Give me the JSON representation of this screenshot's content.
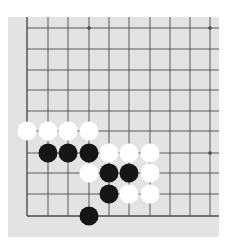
{
  "board": {
    "label": "Go board diagram (lower-left corner region)",
    "background_color": "#e3e3e3",
    "line_color": "#4a4a4a",
    "black_color": "#151515",
    "white_color": "#ffffff",
    "origin_x": 27,
    "origin_y": 28,
    "col_x": [
      27,
      48,
      68,
      89,
      109,
      129,
      150,
      170,
      190,
      210
    ],
    "row_y": [
      28,
      49,
      70,
      90,
      111,
      131,
      153,
      173,
      194,
      216
    ],
    "star_points": [
      {
        "col": 3,
        "row": 0
      },
      {
        "col": 9,
        "row": 0
      },
      {
        "col": 9,
        "row": 6
      }
    ],
    "stone_radius": 9.5,
    "stones": [
      {
        "color": "white",
        "col": 0,
        "row": 5
      },
      {
        "color": "white",
        "col": 1,
        "row": 5
      },
      {
        "color": "white",
        "col": 2,
        "row": 5
      },
      {
        "color": "white",
        "col": 3,
        "row": 5
      },
      {
        "color": "black",
        "col": 1,
        "row": 6
      },
      {
        "color": "black",
        "col": 2,
        "row": 6
      },
      {
        "color": "black",
        "col": 3,
        "row": 6
      },
      {
        "color": "white",
        "col": 4,
        "row": 6
      },
      {
        "color": "white",
        "col": 5,
        "row": 6
      },
      {
        "color": "white",
        "col": 6,
        "row": 6
      },
      {
        "color": "white",
        "col": 3,
        "row": 7
      },
      {
        "color": "black",
        "col": 4,
        "row": 7
      },
      {
        "color": "black",
        "col": 5,
        "row": 7
      },
      {
        "color": "white",
        "col": 6,
        "row": 7
      },
      {
        "color": "black",
        "col": 4,
        "row": 8
      },
      {
        "color": "white",
        "col": 5,
        "row": 8
      },
      {
        "color": "white",
        "col": 6,
        "row": 8
      },
      {
        "color": "black",
        "col": 3,
        "row": 9
      }
    ]
  }
}
